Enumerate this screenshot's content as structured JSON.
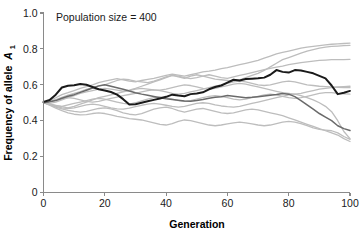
{
  "chart_data": {
    "type": "line",
    "title": "",
    "annotation": "Population size = 400",
    "xlabel": "Generation",
    "ylabel_text": "Frequency of allele",
    "ylabel_symbol": "A",
    "ylabel_subscript": "1",
    "xlim": [
      0,
      100
    ],
    "ylim": [
      0,
      1.0
    ],
    "grid": false,
    "legend": "none",
    "xticks": [
      0,
      20,
      40,
      60,
      80,
      100
    ],
    "xtick_labels": [
      "0",
      "20",
      "40",
      "60",
      "80",
      "100"
    ],
    "yticks": [
      0,
      0.2,
      0.4,
      0.6,
      0.8,
      1.0
    ],
    "ytick_labels": [
      "0",
      "0.2",
      "0.4",
      "0.6",
      "0.8",
      "1.0"
    ],
    "x": [
      0,
      2,
      4,
      6,
      8,
      10,
      12,
      14,
      16,
      18,
      20,
      22,
      24,
      26,
      28,
      30,
      32,
      34,
      36,
      38,
      40,
      42,
      44,
      46,
      48,
      50,
      52,
      54,
      56,
      58,
      60,
      62,
      64,
      66,
      68,
      70,
      72,
      74,
      76,
      78,
      80,
      82,
      84,
      86,
      88,
      90,
      92,
      94,
      96,
      98,
      100
    ],
    "colors": {
      "highlight_dark": "#1a1a1a",
      "highlight_medium": "#6a6a6a",
      "background_light": "#bdbdbd",
      "axis": "#8a8a8a",
      "text": "#1a1a1a"
    },
    "series": [
      {
        "name": "replicate-1-highlight-dark",
        "color": "#1a1a1a",
        "width": 2.0,
        "values": [
          0.505,
          0.515,
          0.545,
          0.585,
          0.595,
          0.598,
          0.605,
          0.6,
          0.588,
          0.575,
          0.568,
          0.56,
          0.545,
          0.52,
          0.49,
          0.492,
          0.5,
          0.508,
          0.516,
          0.524,
          0.533,
          0.545,
          0.54,
          0.536,
          0.548,
          0.552,
          0.558,
          0.575,
          0.588,
          0.596,
          0.612,
          0.628,
          0.624,
          0.632,
          0.634,
          0.636,
          0.64,
          0.656,
          0.682,
          0.672,
          0.668,
          0.682,
          0.68,
          0.672,
          0.664,
          0.65,
          0.636,
          0.596,
          0.548,
          0.556,
          0.566
        ]
      },
      {
        "name": "replicate-2-highlight-medium",
        "color": "#6a6a6a",
        "width": 1.5,
        "values": [
          0.5,
          0.505,
          0.512,
          0.525,
          0.536,
          0.545,
          0.558,
          0.57,
          0.582,
          0.594,
          0.6,
          0.592,
          0.584,
          0.575,
          0.565,
          0.556,
          0.548,
          0.542,
          0.535,
          0.528,
          0.522,
          0.518,
          0.514,
          0.51,
          0.508,
          0.512,
          0.518,
          0.525,
          0.53,
          0.534,
          0.54,
          0.536,
          0.532,
          0.528,
          0.53,
          0.534,
          0.538,
          0.542,
          0.546,
          0.552,
          0.548,
          0.534,
          0.512,
          0.488,
          0.464,
          0.44,
          0.42,
          0.4,
          0.372,
          0.356,
          0.345
        ]
      },
      {
        "name": "replicate-3-background",
        "color": "#bdbdbd",
        "width": 1.3,
        "values": [
          0.5,
          0.512,
          0.528,
          0.545,
          0.556,
          0.568,
          0.58,
          0.59,
          0.6,
          0.612,
          0.62,
          0.628,
          0.634,
          0.628,
          0.62,
          0.616,
          0.624,
          0.63,
          0.636,
          0.644,
          0.652,
          0.66,
          0.654,
          0.648,
          0.656,
          0.664,
          0.672,
          0.676,
          0.682,
          0.69,
          0.696,
          0.704,
          0.712,
          0.72,
          0.728,
          0.736,
          0.748,
          0.76,
          0.772,
          0.78,
          0.788,
          0.796,
          0.804,
          0.81,
          0.814,
          0.818,
          0.822,
          0.826,
          0.828,
          0.83,
          0.832
        ]
      },
      {
        "name": "replicate-4-background",
        "color": "#bdbdbd",
        "width": 1.3,
        "values": [
          0.5,
          0.508,
          0.518,
          0.53,
          0.542,
          0.552,
          0.562,
          0.574,
          0.584,
          0.592,
          0.6,
          0.612,
          0.624,
          0.632,
          0.628,
          0.62,
          0.616,
          0.612,
          0.62,
          0.632,
          0.644,
          0.652,
          0.648,
          0.64,
          0.634,
          0.64,
          0.648,
          0.656,
          0.648,
          0.64,
          0.636,
          0.644,
          0.652,
          0.66,
          0.668,
          0.676,
          0.684,
          0.692,
          0.698,
          0.704,
          0.712,
          0.718,
          0.724,
          0.728,
          0.732,
          0.736,
          0.738,
          0.74,
          0.74,
          0.74,
          0.742
        ]
      },
      {
        "name": "replicate-5-background",
        "color": "#bdbdbd",
        "width": 1.3,
        "values": [
          0.5,
          0.496,
          0.504,
          0.516,
          0.528,
          0.54,
          0.552,
          0.56,
          0.568,
          0.576,
          0.58,
          0.576,
          0.57,
          0.564,
          0.57,
          0.58,
          0.592,
          0.604,
          0.616,
          0.628,
          0.64,
          0.652,
          0.644,
          0.636,
          0.648,
          0.656,
          0.648,
          0.64,
          0.632,
          0.628,
          0.624,
          0.62,
          0.628,
          0.64,
          0.652,
          0.664,
          0.68,
          0.7,
          0.72,
          0.74,
          0.752,
          0.764,
          0.776,
          0.788,
          0.796,
          0.804,
          0.81,
          0.814,
          0.816,
          0.818,
          0.82
        ]
      },
      {
        "name": "replicate-6-background",
        "color": "#bdbdbd",
        "width": 1.3,
        "values": [
          0.5,
          0.494,
          0.486,
          0.478,
          0.472,
          0.48,
          0.492,
          0.504,
          0.516,
          0.528,
          0.536,
          0.544,
          0.552,
          0.56,
          0.568,
          0.576,
          0.58,
          0.576,
          0.572,
          0.57,
          0.576,
          0.584,
          0.592,
          0.6,
          0.596,
          0.588,
          0.58,
          0.576,
          0.58,
          0.588,
          0.596,
          0.604,
          0.608,
          0.604,
          0.596,
          0.588,
          0.58,
          0.572,
          0.564,
          0.556,
          0.552,
          0.548,
          0.552,
          0.56,
          0.568,
          0.576,
          0.58,
          0.584,
          0.588,
          0.59,
          0.592
        ]
      },
      {
        "name": "replicate-7-background",
        "color": "#bdbdbd",
        "width": 1.3,
        "values": [
          0.5,
          0.492,
          0.484,
          0.48,
          0.488,
          0.496,
          0.504,
          0.512,
          0.52,
          0.524,
          0.52,
          0.512,
          0.504,
          0.496,
          0.492,
          0.5,
          0.51,
          0.52,
          0.528,
          0.532,
          0.528,
          0.52,
          0.512,
          0.508,
          0.512,
          0.52,
          0.528,
          0.536,
          0.54,
          0.536,
          0.528,
          0.52,
          0.516,
          0.52,
          0.528,
          0.536,
          0.544,
          0.548,
          0.544,
          0.536,
          0.528,
          0.524,
          0.528,
          0.536,
          0.544,
          0.552,
          0.556,
          0.556,
          0.552,
          0.55,
          0.548
        ]
      },
      {
        "name": "replicate-8-background",
        "color": "#bdbdbd",
        "width": 1.3,
        "values": [
          0.5,
          0.49,
          0.48,
          0.472,
          0.468,
          0.472,
          0.48,
          0.488,
          0.492,
          0.488,
          0.48,
          0.472,
          0.466,
          0.464,
          0.47,
          0.478,
          0.486,
          0.492,
          0.496,
          0.492,
          0.486,
          0.48,
          0.476,
          0.48,
          0.488,
          0.496,
          0.5,
          0.496,
          0.488,
          0.482,
          0.478,
          0.476,
          0.48,
          0.488,
          0.496,
          0.504,
          0.512,
          0.52,
          0.528,
          0.536,
          0.544,
          0.548,
          0.54,
          0.528,
          0.516,
          0.5,
          0.48,
          0.45,
          0.4,
          0.34,
          0.3
        ]
      },
      {
        "name": "replicate-9-background",
        "color": "#bdbdbd",
        "width": 1.3,
        "values": [
          0.5,
          0.488,
          0.476,
          0.466,
          0.458,
          0.452,
          0.448,
          0.452,
          0.46,
          0.468,
          0.472,
          0.466,
          0.456,
          0.444,
          0.436,
          0.432,
          0.44,
          0.452,
          0.464,
          0.472,
          0.476,
          0.468,
          0.456,
          0.448,
          0.456,
          0.464,
          0.468,
          0.46,
          0.452,
          0.444,
          0.44,
          0.444,
          0.452,
          0.46,
          0.464,
          0.46,
          0.452,
          0.444,
          0.436,
          0.428,
          0.416,
          0.404,
          0.392,
          0.38,
          0.368,
          0.356,
          0.344,
          0.332,
          0.32,
          0.3,
          0.284
        ]
      },
      {
        "name": "replicate-10-background",
        "color": "#bdbdbd",
        "width": 1.3,
        "values": [
          0.5,
          0.486,
          0.47,
          0.456,
          0.444,
          0.436,
          0.432,
          0.434,
          0.44,
          0.444,
          0.44,
          0.432,
          0.424,
          0.418,
          0.412,
          0.408,
          0.404,
          0.396,
          0.388,
          0.38,
          0.376,
          0.384,
          0.396,
          0.404,
          0.4,
          0.392,
          0.384,
          0.376,
          0.372,
          0.376,
          0.382,
          0.388,
          0.392,
          0.388,
          0.382,
          0.376,
          0.372,
          0.376,
          0.384,
          0.392,
          0.396,
          0.392,
          0.384,
          0.372,
          0.36,
          0.352,
          0.348,
          0.344,
          0.332,
          0.312,
          0.296
        ]
      },
      {
        "name": "replicate-11-background",
        "color": "#bdbdbd",
        "width": 1.3,
        "values": [
          0.5,
          0.506,
          0.514,
          0.522,
          0.528,
          0.524,
          0.516,
          0.508,
          0.504,
          0.508,
          0.516,
          0.524,
          0.532,
          0.54,
          0.546,
          0.552,
          0.56,
          0.568,
          0.572,
          0.568,
          0.56,
          0.552,
          0.548,
          0.552,
          0.56,
          0.568,
          0.576,
          0.584,
          0.592,
          0.6,
          0.608,
          0.616,
          0.62,
          0.616,
          0.608,
          0.6,
          0.596,
          0.6,
          0.608,
          0.616,
          0.62,
          0.616,
          0.608,
          0.6,
          0.596,
          0.592,
          0.59,
          0.588,
          0.586,
          0.584,
          0.584
        ]
      }
    ]
  }
}
